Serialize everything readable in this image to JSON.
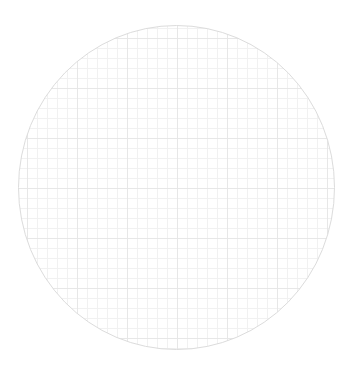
{
  "figure": {
    "width": 353,
    "height": 373,
    "background_color": "#ffffff",
    "title": "",
    "subtitle": ""
  },
  "chart_data": {
    "type": "heatmap",
    "title": "",
    "subtitle": "",
    "xlabel": "",
    "ylabel": "",
    "shape": "circle",
    "clip": "circular",
    "legend": {
      "visible": false,
      "position": "none",
      "entries": []
    },
    "axes": {
      "visible": false,
      "x_ticks": [],
      "y_ticks": [],
      "x_tick_labels": [],
      "y_tick_labels": [],
      "xlim": [
        0,
        1
      ],
      "ylim": [
        0,
        1
      ]
    },
    "grid": {
      "visible": true,
      "minor_spacing_px": 10,
      "major_spacing_px": 50,
      "minor_color": "#f1f1f1",
      "major_color": "#e7e7e7",
      "minor_width": 1,
      "major_width": 1,
      "orientation": "rectangular"
    },
    "series": [],
    "values": [],
    "categories": [],
    "annotations": []
  },
  "circle": {
    "center_x": 176.5,
    "center_y": 187.5,
    "radius_x": 158,
    "radius_y": 162,
    "fill_color": "#ffffff",
    "stroke_color": "#dcdcdc",
    "stroke_width": 1
  },
  "colors": {
    "background": "#ffffff",
    "grid_minor": "#f1f1f1",
    "grid_major": "#e7e7e7",
    "outline": "#dcdcdc"
  }
}
